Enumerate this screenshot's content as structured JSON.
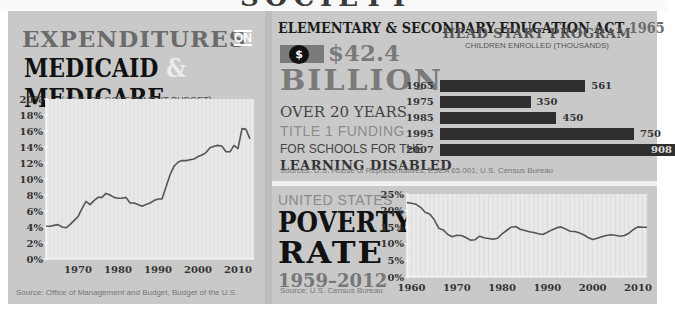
{
  "top_banner": {
    "partial_title": "SOCIETY"
  },
  "medicaid": {
    "title_line1": "EXPENDITURES",
    "title_on": "ON",
    "title_medicaid": "MEDICAID",
    "title_amp": "&",
    "title_medicare": "MEDICARE",
    "subtitle": "(AS % OF GOVERNMENT BUDGET)",
    "source": "Source: Office of Management and Budget, Budget of the U.S."
  },
  "education": {
    "title": "ELEMENTARY & SECONDARY EDUCATION ACT",
    "title_year": "1965",
    "dollar_icon": "$",
    "amount": "$42.4",
    "billion": "BILLION",
    "line1": "OVER 20 YEARS",
    "line2": "TITLE 1 FUNDING",
    "line3": "FOR SCHOOLS FOR THE",
    "line4": "LEARNING DISABLED",
    "head_start_title": "HEAD START PROGRAM",
    "head_start_subtitle": "CHILDREN ENROLLED (THOUSANDS)",
    "source": "Sources: U.S. House of Representatives, ESEA 65.001; U.S. Census Bureau"
  },
  "poverty": {
    "label_us": "UNITED STATES",
    "label_poverty": "POVERTY",
    "label_rate": "RATE",
    "label_years": "1959–2012",
    "source": "Source: U.S. Census Bureau"
  },
  "colors": {
    "panel_bg": "#c9c9c9",
    "plot_bg": "#e9e9e9",
    "line": "#555555",
    "bar": "#2f2f2f",
    "title_dark": "#111111",
    "title_gray": "#6b6b6b"
  },
  "chart_data": [
    {
      "type": "line",
      "title": "Expenditures on Medicaid & Medicare",
      "subtitle": "(As % of Government Budget)",
      "xlabel": "",
      "ylabel": "",
      "ylim": [
        0,
        20
      ],
      "xlim": [
        1962,
        2014
      ],
      "yticks": [
        "0%",
        "2%",
        "4%",
        "6%",
        "8%",
        "10%",
        "12%",
        "14%",
        "16%",
        "18%",
        "20%"
      ],
      "xticks": [
        "1970",
        "1980",
        "1990",
        "2000",
        "2010"
      ],
      "grid": "vertical",
      "x": [
        1962,
        1963,
        1964,
        1965,
        1966,
        1967,
        1968,
        1969,
        1970,
        1971,
        1972,
        1973,
        1974,
        1975,
        1976,
        1977,
        1978,
        1979,
        1980,
        1981,
        1982,
        1983,
        1984,
        1985,
        1986,
        1987,
        1988,
        1989,
        1990,
        1991,
        1992,
        1993,
        1994,
        1995,
        1996,
        1997,
        1998,
        1999,
        2000,
        2001,
        2002,
        2003,
        2004,
        2005,
        2006,
        2007,
        2008,
        2009,
        2010,
        2011,
        2012,
        2013
      ],
      "series": [
        {
          "name": "Medicaid & Medicare",
          "values": [
            4.1,
            4.1,
            4.2,
            4.3,
            4.0,
            3.9,
            4.3,
            4.8,
            5.3,
            6.3,
            7.2,
            6.8,
            7.3,
            7.7,
            7.7,
            8.2,
            8.0,
            7.7,
            7.6,
            7.6,
            7.7,
            7.0,
            7.0,
            6.8,
            6.6,
            6.8,
            7.0,
            7.3,
            7.5,
            7.5,
            9.0,
            10.5,
            11.6,
            12.1,
            12.3,
            12.3,
            12.4,
            12.5,
            12.8,
            13.0,
            13.3,
            13.9,
            14.1,
            14.2,
            14.1,
            13.4,
            13.4,
            14.2,
            13.8,
            16.3,
            16.2,
            15.0
          ]
        }
      ]
    },
    {
      "type": "bar",
      "orientation": "horizontal",
      "title": "Head Start Program",
      "subtitle": "Children Enrolled (Thousands)",
      "categories": [
        "1965",
        "1975",
        "1985",
        "1995",
        "2007"
      ],
      "values": [
        561,
        350,
        450,
        750,
        908
      ]
    },
    {
      "type": "line",
      "title": "United States Poverty Rate 1959–2012",
      "xlabel": "",
      "ylabel": "",
      "ylim": [
        0,
        25
      ],
      "xlim": [
        1959,
        2012
      ],
      "yticks": [
        "0%",
        "5%",
        "10%",
        "15%",
        "20%",
        "25%"
      ],
      "xticks": [
        "1960",
        "1970",
        "1980",
        "1990",
        "2000",
        "2010"
      ],
      "grid": "vertical",
      "x": [
        1959,
        1960,
        1961,
        1962,
        1963,
        1964,
        1965,
        1966,
        1967,
        1968,
        1969,
        1970,
        1971,
        1972,
        1973,
        1974,
        1975,
        1976,
        1977,
        1978,
        1979,
        1980,
        1981,
        1982,
        1983,
        1984,
        1985,
        1986,
        1987,
        1988,
        1989,
        1990,
        1991,
        1992,
        1993,
        1994,
        1995,
        1996,
        1997,
        1998,
        1999,
        2000,
        2001,
        2002,
        2003,
        2004,
        2005,
        2006,
        2007,
        2008,
        2009,
        2010,
        2011,
        2012
      ],
      "series": [
        {
          "name": "Poverty rate",
          "values": [
            22.4,
            22.2,
            21.9,
            21.0,
            19.5,
            19.0,
            17.3,
            14.7,
            14.2,
            12.8,
            12.1,
            12.6,
            12.5,
            11.9,
            11.1,
            11.2,
            12.3,
            11.8,
            11.6,
            11.4,
            11.7,
            13.0,
            14.0,
            15.0,
            15.2,
            14.4,
            14.0,
            13.6,
            13.4,
            13.0,
            12.8,
            13.5,
            14.2,
            14.8,
            15.1,
            14.5,
            13.8,
            13.7,
            13.3,
            12.7,
            11.9,
            11.3,
            11.7,
            12.1,
            12.5,
            12.7,
            12.6,
            12.3,
            12.5,
            13.2,
            14.3,
            15.1,
            15.0,
            15.0
          ]
        }
      ]
    }
  ]
}
